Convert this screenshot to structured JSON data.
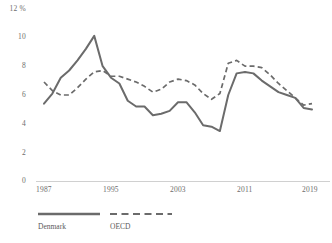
{
  "chart_data": {
    "type": "line",
    "title": "",
    "subtitle": "",
    "xlabel": "",
    "ylabel": "",
    "yunit": "%",
    "y_axis_top_label": "12 %",
    "yticks": [
      0,
      2,
      4,
      6,
      8,
      10,
      12
    ],
    "ytick_labels": [
      "0",
      "2",
      "4",
      "6",
      "8",
      "10",
      "12 %"
    ],
    "ylim": [
      0,
      12
    ],
    "xticks": [
      1987,
      1995,
      2003,
      2011,
      2019
    ],
    "xtick_labels": [
      "1987",
      "1995",
      "2003",
      "2011",
      "2019"
    ],
    "xlim": [
      1987,
      2019
    ],
    "grid": false,
    "legend_position": "bottom-left",
    "x": [
      1987,
      1988,
      1989,
      1990,
      1991,
      1992,
      1993,
      1994,
      1995,
      1996,
      1997,
      1998,
      1999,
      2000,
      2001,
      2002,
      2003,
      2004,
      2005,
      2006,
      2007,
      2008,
      2009,
      2010,
      2011,
      2012,
      2013,
      2014,
      2015,
      2016,
      2017,
      2018,
      2019
    ],
    "series": [
      {
        "name": "Denmark",
        "style": "solid",
        "color": "#6b6b6b",
        "values": [
          5.4,
          6.1,
          7.2,
          7.7,
          8.4,
          9.2,
          10.1,
          8.0,
          7.2,
          6.8,
          5.6,
          5.2,
          5.2,
          4.6,
          4.7,
          4.9,
          5.5,
          5.5,
          4.8,
          3.9,
          3.8,
          3.5,
          6.0,
          7.5,
          7.6,
          7.5,
          7.0,
          6.6,
          6.2,
          6.0,
          5.8,
          5.1,
          5.0
        ]
      },
      {
        "name": "OECD",
        "style": "dashed",
        "color": "#6b6b6b",
        "values": [
          6.9,
          6.3,
          6.0,
          6.0,
          6.5,
          7.1,
          7.6,
          7.7,
          7.3,
          7.3,
          7.1,
          6.9,
          6.6,
          6.2,
          6.4,
          6.9,
          7.1,
          7.0,
          6.7,
          6.1,
          5.7,
          6.1,
          8.2,
          8.4,
          8.0,
          8.0,
          7.9,
          7.4,
          6.8,
          6.3,
          5.8,
          5.3,
          5.4
        ]
      }
    ]
  },
  "legend": {
    "items": [
      {
        "label": "Denmark",
        "style": "solid"
      },
      {
        "label": "OECD",
        "style": "dashed"
      }
    ]
  },
  "axis": {
    "baseline_color": "#d0d0d0"
  }
}
